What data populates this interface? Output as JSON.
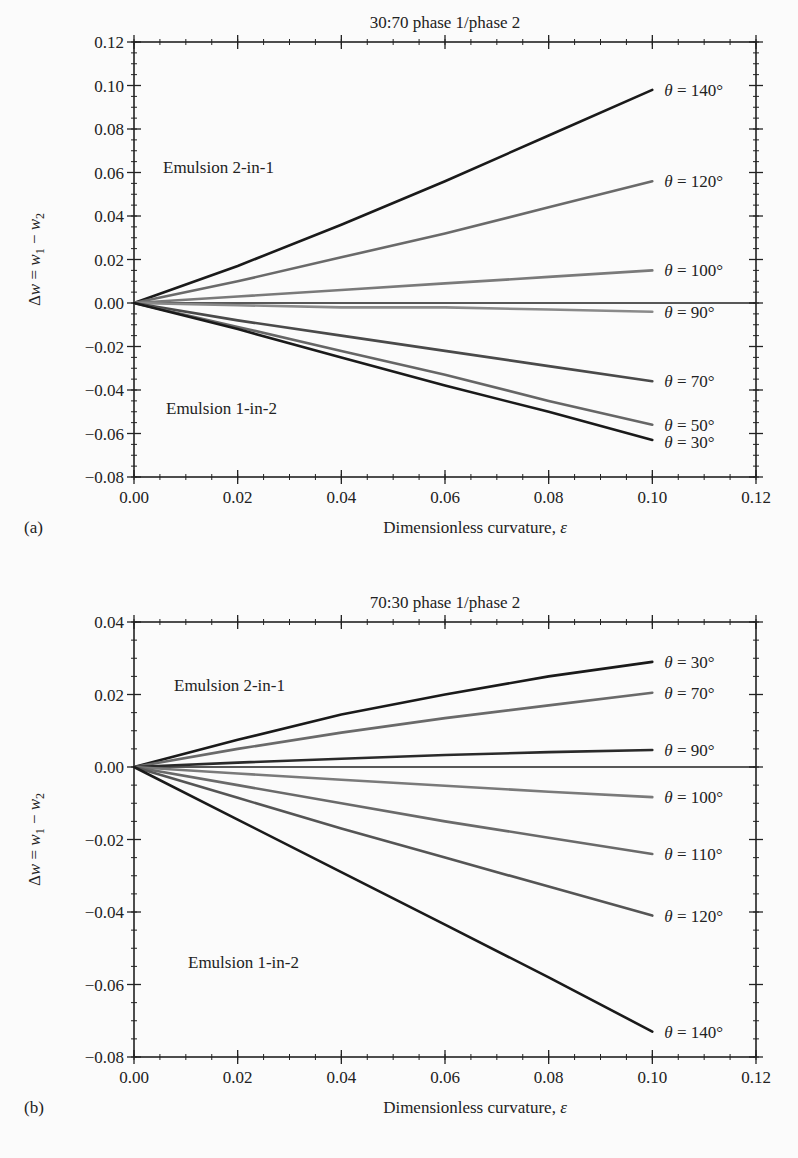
{
  "chart_data": [
    {
      "type": "line",
      "panel": "(a)",
      "title": "30:70  phase 1/phase 2",
      "xlabel": "Dimensionless curvature, ε",
      "ylabel": "Δw = w1 − w2",
      "xlim": [
        0.0,
        0.12
      ],
      "ylim": [
        -0.08,
        0.12
      ],
      "xticks": [
        "0.00",
        "0.02",
        "0.04",
        "0.06",
        "0.08",
        "0.10",
        "0.12"
      ],
      "yticks": [
        "0.12",
        "0.10",
        "0.08",
        "0.06",
        "0.04",
        "0.02",
        "0.00",
        "−0.02",
        "−0.04",
        "−0.06",
        "−0.08"
      ],
      "grid": false,
      "annotations": [
        "Emulsion 2-in-1",
        "Emulsion 1-in-2"
      ],
      "x": [
        0.0,
        0.02,
        0.04,
        0.06,
        0.08,
        0.1
      ],
      "series": [
        {
          "name": "θ = 140°",
          "color": "#1a1a1a",
          "values": [
            0.0,
            0.017,
            0.036,
            0.056,
            0.077,
            0.098
          ]
        },
        {
          "name": "θ = 120°",
          "color": "#6a6a6a",
          "values": [
            0.0,
            0.01,
            0.021,
            0.032,
            0.044,
            0.056
          ]
        },
        {
          "name": "θ = 100°",
          "color": "#7a7a7a",
          "values": [
            0.0,
            0.003,
            0.006,
            0.009,
            0.012,
            0.015
          ]
        },
        {
          "name": "θ = 90°",
          "color": "#8a8a8a",
          "values": [
            0.0,
            -0.001,
            -0.002,
            -0.002,
            -0.003,
            -0.004
          ]
        },
        {
          "name": "θ = 70°",
          "color": "#4a4a4a",
          "values": [
            0.0,
            -0.008,
            -0.015,
            -0.022,
            -0.029,
            -0.036
          ]
        },
        {
          "name": "θ = 50°",
          "color": "#666666",
          "values": [
            0.0,
            -0.011,
            -0.022,
            -0.033,
            -0.045,
            -0.056
          ]
        },
        {
          "name": "θ = 30°",
          "color": "#1a1a1a",
          "values": [
            0.0,
            -0.012,
            -0.025,
            -0.038,
            -0.05,
            -0.063
          ]
        }
      ]
    },
    {
      "type": "line",
      "panel": "(b)",
      "title": "70:30  phase 1/phase 2",
      "xlabel": "Dimensionless curvature, ε",
      "ylabel": "Δw = w1 − w2",
      "xlim": [
        0.0,
        0.12
      ],
      "ylim": [
        -0.08,
        0.04
      ],
      "xticks": [
        "0.00",
        "0.02",
        "0.04",
        "0.06",
        "0.08",
        "0.10",
        "0.12"
      ],
      "yticks": [
        "0.04",
        "0.02",
        "0.00",
        "−0.02",
        "−0.04",
        "−0.06",
        "−0.08"
      ],
      "grid": false,
      "annotations": [
        "Emulsion 2-in-1",
        "Emulsion 1-in-2"
      ],
      "x": [
        0.0,
        0.02,
        0.04,
        0.06,
        0.08,
        0.1
      ],
      "series": [
        {
          "name": "θ = 30°",
          "color": "#1a1a1a",
          "values": [
            0.0,
            0.0075,
            0.0145,
            0.02,
            0.025,
            0.029
          ]
        },
        {
          "name": "θ = 70°",
          "color": "#6a6a6a",
          "values": [
            0.0,
            0.005,
            0.0095,
            0.0135,
            0.017,
            0.0205
          ]
        },
        {
          "name": "θ = 90°",
          "color": "#2a2a2a",
          "values": [
            0.0,
            0.0012,
            0.0023,
            0.0033,
            0.0041,
            0.0047
          ]
        },
        {
          "name": "θ = 100°",
          "color": "#7a7a7a",
          "values": [
            0.0,
            -0.0018,
            -0.0035,
            -0.0052,
            -0.0068,
            -0.0083
          ]
        },
        {
          "name": "θ = 110°",
          "color": "#6a6a6a",
          "values": [
            0.0,
            -0.005,
            -0.01,
            -0.015,
            -0.0195,
            -0.024
          ]
        },
        {
          "name": "θ = 120°",
          "color": "#555555",
          "values": [
            0.0,
            -0.0085,
            -0.017,
            -0.025,
            -0.033,
            -0.041
          ]
        },
        {
          "name": "θ = 140°",
          "color": "#1a1a1a",
          "values": [
            0.0,
            -0.0145,
            -0.029,
            -0.0435,
            -0.058,
            -0.073
          ]
        }
      ]
    }
  ],
  "figure": {
    "a": {
      "panel_label": "(a)",
      "title": "30:70  phase 1/phase 2",
      "xlabel": "Dimensionless curvature, ε",
      "annotation_top": "Emulsion 2-in-1",
      "annotation_bottom": "Emulsion 1-in-2"
    },
    "b": {
      "panel_label": "(b)",
      "title": "70:30  phase 1/phase 2",
      "xlabel": "Dimensionless curvature, ε",
      "annotation_top": "Emulsion 2-in-1",
      "annotation_bottom": "Emulsion 1-in-2"
    }
  }
}
